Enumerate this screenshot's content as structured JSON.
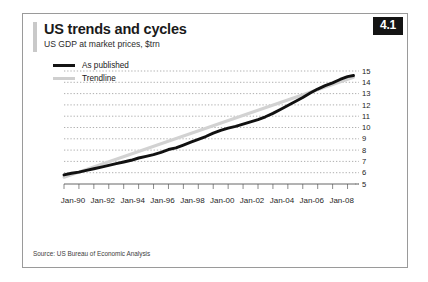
{
  "figure": {
    "badge": "4.1",
    "title": "US trends and cycles",
    "subtitle": "US GDP at market prices, $trn",
    "source": "Source: US Bureau of Economic Analysis"
  },
  "legend": {
    "position": "top-left",
    "items": [
      {
        "label": "As published",
        "color": "#111111",
        "style": "thick-solid"
      },
      {
        "label": "Trendline",
        "color": "#d2d2d2",
        "style": "solid"
      }
    ]
  },
  "colors": {
    "published": "#111111",
    "trendline": "#d2d2d2",
    "gridline": "#8d8d8d",
    "badge_background": "#141414",
    "badge_text": "#ffffff",
    "frame_border": "#9a9a9a",
    "accent_bar": "#c9c9c9"
  },
  "chart_data": {
    "type": "line",
    "title": "US trends and cycles",
    "subtitle": "US GDP at market prices, $trn",
    "xlabel": "",
    "ylabel": "$trn",
    "ylim": [
      5,
      15
    ],
    "yticks": [
      5,
      6,
      7,
      8,
      9,
      10,
      11,
      12,
      13,
      14,
      15
    ],
    "ytick_labels": [
      "5",
      "6",
      "7",
      "8",
      "9",
      "10",
      "11",
      "12",
      "13",
      "14",
      "15"
    ],
    "grid": true,
    "grid_axis": "y",
    "xlim": [
      1990,
      2009.5
    ],
    "xticks": [
      1990,
      1992,
      1994,
      1996,
      1998,
      2000,
      2002,
      2004,
      2006,
      2008
    ],
    "xtick_labels": [
      "Jan-90",
      "Jan-92",
      "Jan-94",
      "Jan-96",
      "Jan-98",
      "Jan-00",
      "Jan-02",
      "Jan-04",
      "Jan-06",
      "Jan-08"
    ],
    "minor_xticks": [
      1990,
      1991,
      1992,
      1993,
      1994,
      1995,
      1996,
      1997,
      1998,
      1999,
      2000,
      2001,
      2002,
      2003,
      2004,
      2005,
      2006,
      2007,
      2008,
      2009
    ],
    "series": [
      {
        "name": "As published",
        "color": "#111111",
        "x": [
          1990.0,
          1990.5,
          1991.0,
          1991.5,
          1992.0,
          1992.5,
          1993.0,
          1993.5,
          1994.0,
          1994.5,
          1995.0,
          1995.5,
          1996.0,
          1996.5,
          1997.0,
          1997.5,
          1998.0,
          1998.5,
          1999.0,
          1999.5,
          2000.0,
          2000.5,
          2001.0,
          2001.5,
          2002.0,
          2002.5,
          2003.0,
          2003.5,
          2004.0,
          2004.5,
          2005.0,
          2005.5,
          2006.0,
          2006.5,
          2007.0,
          2007.5,
          2008.0,
          2008.5,
          2009.0,
          2009.4
        ],
        "values": [
          5.8,
          5.95,
          6.05,
          6.2,
          6.35,
          6.5,
          6.65,
          6.8,
          6.95,
          7.1,
          7.3,
          7.45,
          7.6,
          7.8,
          8.05,
          8.2,
          8.45,
          8.7,
          8.95,
          9.2,
          9.5,
          9.75,
          9.95,
          10.1,
          10.3,
          10.5,
          10.7,
          10.95,
          11.25,
          11.6,
          11.95,
          12.3,
          12.65,
          13.05,
          13.4,
          13.7,
          13.95,
          14.25,
          14.5,
          14.6
        ]
      },
      {
        "name": "Trendline",
        "color": "#d2d2d2",
        "x": [
          1990.0,
          2009.4
        ],
        "values": [
          5.6,
          14.45
        ]
      }
    ],
    "annotations": [
      {
        "text": "Final black segment shows a dip then flat reading near 14.4",
        "x": 2009.0,
        "y": 14.4
      }
    ]
  }
}
